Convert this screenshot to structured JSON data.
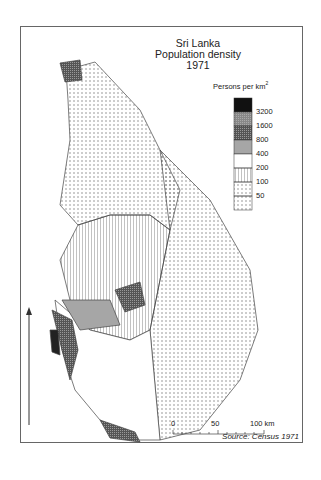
{
  "title": [
    "Sri Lanka",
    "Population density",
    "1971"
  ],
  "legend": {
    "heading": "Persons per km",
    "superscript": "2",
    "classes": [
      "3200",
      "1600",
      "800",
      "400",
      "200",
      "100",
      "50"
    ]
  },
  "scale": {
    "labels": [
      "0",
      "50",
      "100 km"
    ]
  },
  "source": "Source: Census 1971",
  "north_arrow": "north-arrow"
}
